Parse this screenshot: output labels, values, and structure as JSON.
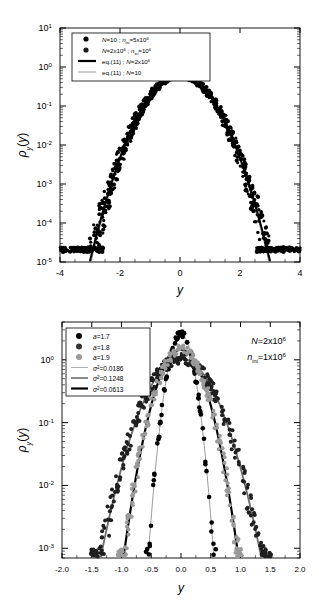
{
  "figure": {
    "panels": [
      "top-panel",
      "bottom-panel"
    ],
    "background": "#ffffff",
    "ink": "#000000",
    "gray": "#8c8c8c"
  },
  "chart_data": [
    {
      "id": "top-panel",
      "type": "scatter",
      "title": "",
      "xlabel": "y",
      "ylabel": "ρy(y)",
      "yscale": "log",
      "xscale": "linear",
      "xlim": [
        -4,
        4
      ],
      "ylim": [
        1e-05,
        10
      ],
      "grid": false,
      "legend_position": "upper-left",
      "xticks": [
        -4,
        -2,
        0,
        2,
        4
      ],
      "xticklabels": [
        "-4",
        "-2",
        "0",
        "2",
        "4"
      ],
      "yticks": [
        1e-05,
        0.0001,
        0.001,
        0.01,
        0.1,
        1,
        10
      ],
      "yticklabels": [
        "10-5",
        "10-4",
        "10-3",
        "10-2",
        "10-1",
        "100",
        "101"
      ],
      "ytick_exponents": [
        "-5",
        "-4",
        "-3",
        "-2",
        "-1",
        "0",
        "1"
      ],
      "legend": [
        {
          "marker": "circle",
          "color": "#000000",
          "label": "N=10 ; nini=5x106",
          "label_parts": {
            "N": "N=10",
            "sep": " ; ",
            "n": "n",
            "nsub": "ini",
            "neq": "=5x10",
            "nexp": "6"
          }
        },
        {
          "marker": "circle",
          "color": "#1a1a1a",
          "label": "N=2x106 ; nini=106",
          "label_parts": {
            "N": "N=2x10",
            "Nexp": "6",
            "sep": " ; ",
            "n": "n",
            "nsub": "ini",
            "neq": "=10",
            "nexp": "6"
          }
        },
        {
          "marker": "line-thick",
          "color": "#000000",
          "label": "eq.(11) ; N=2x106",
          "label_parts": {
            "eq": "eq.(11) ; ",
            "N": "N=2x10",
            "Nexp": "6"
          }
        },
        {
          "marker": "line-thin",
          "color": "#8c8c8c",
          "label": "eq.(11) ; N=10",
          "label_parts": {
            "eq": "eq.(11) ; ",
            "N": "N=10"
          }
        }
      ],
      "series": [
        {
          "name": "eq.(11) ; N=2x10^6",
          "kind": "line",
          "color": "#000000",
          "width": 2.2,
          "sigma2": 0.41,
          "peak": 0.62,
          "x_range": [
            -3.35,
            3.35
          ]
        },
        {
          "name": "eq.(11) ; N=10",
          "kind": "line",
          "color": "#8c8c8c",
          "width": 1.0,
          "sigma2": 0.4,
          "peak": 0.6,
          "x_range": [
            -3.3,
            3.3
          ]
        },
        {
          "name": "N=10 ; nini=5x10^6",
          "kind": "scatter",
          "color": "#000000",
          "noise_floor": 2e-05,
          "x_extent": [
            -4.0,
            4.0
          ]
        },
        {
          "name": "N=2x10^6 ; nini=10^6",
          "kind": "scatter",
          "color": "#000000",
          "noise_floor": 2e-05,
          "x_extent": [
            -3.1,
            3.1
          ]
        }
      ],
      "points_note": "Gaussian-like cloud rho(y)~exp(-y^2/2sigma^2) with saturation floor 2e-5 spreading to |y|=4"
    },
    {
      "id": "bottom-panel",
      "type": "scatter",
      "title": "",
      "xlabel": "y",
      "ylabel": "ρy(y)",
      "yscale": "log",
      "xscale": "linear",
      "xlim": [
        -2.0,
        2.0
      ],
      "ylim": [
        0.0007,
        4.0
      ],
      "grid": false,
      "legend_position": "upper-left",
      "xticks": [
        -2.0,
        -1.5,
        -1.0,
        -0.5,
        0.0,
        0.5,
        1.0,
        1.5,
        2.0
      ],
      "xticklabels": [
        "-2.0",
        "-1.5",
        "-1.0",
        "-0.5",
        "0.0",
        "0.5",
        "1.0",
        "1.5",
        "2.0"
      ],
      "yticks": [
        0.001,
        0.01,
        0.1,
        1
      ],
      "yticklabels": [
        "10-3",
        "10-2",
        "10-1",
        "100"
      ],
      "ytick_exponents": [
        "-3",
        "-2",
        "-1",
        "0"
      ],
      "annotation": {
        "line1": "N=2x106",
        "line1_parts": {
          "base": "N=2x10",
          "exp": "6"
        },
        "line2": "nini=1x106",
        "line2_parts": {
          "sym": "n",
          "sub": "ini",
          "base": "=1x10",
          "exp": "6"
        }
      },
      "legend": [
        {
          "marker": "circle",
          "color": "#000000",
          "label": "a=1.7",
          "label_parts": {
            "sym": "a",
            "val": "=1.7"
          }
        },
        {
          "marker": "circle",
          "color": "#333333",
          "label": "a=1.8",
          "label_parts": {
            "sym": "a",
            "val": "=1.8"
          }
        },
        {
          "marker": "circle",
          "color": "#9a9a9a",
          "label": "a=1.9",
          "label_parts": {
            "sym": "a",
            "val": "=1.9"
          }
        },
        {
          "marker": "line-thin",
          "color": "#9a9a9a",
          "label": "σ2=0.0186",
          "label_parts": {
            "sym": "σ",
            "exp": "2",
            "val": "=0.0186"
          }
        },
        {
          "marker": "line-med",
          "color": "#6e6e6e",
          "label": "σ2=0.1248",
          "label_parts": {
            "sym": "σ",
            "exp": "2",
            "val": "=0.1248"
          }
        },
        {
          "marker": "line-thick",
          "color": "#000000",
          "label": "σ2=0.0613",
          "label_parts": {
            "sym": "σ",
            "exp": "2",
            "val": "=0.0613"
          }
        }
      ],
      "series": [
        {
          "name": "a=1.7",
          "kind": "scatter",
          "color": "#000000",
          "sigma2": 0.0186,
          "peak": 2.6,
          "x_extent": [
            -0.58,
            0.58
          ]
        },
        {
          "name": "a=1.8",
          "kind": "scatter",
          "color": "#1f1f1f",
          "sigma2": 0.1248,
          "peak": 1.05,
          "x_extent": [
            -1.52,
            1.38
          ]
        },
        {
          "name": "a=1.9",
          "kind": "scatter",
          "color": "#9a9a9a",
          "sigma2": 0.0613,
          "peak": 1.45,
          "x_extent": [
            -1.08,
            1.02
          ]
        },
        {
          "name": "sigma2=0.0186",
          "kind": "line",
          "color": "#9a9a9a",
          "width": 1.0,
          "sigma2": 0.0186,
          "peak": 2.6
        },
        {
          "name": "sigma2=0.1248",
          "kind": "line",
          "color": "#6e6e6e",
          "width": 1.8,
          "sigma2": 0.1248,
          "peak": 1.05
        },
        {
          "name": "sigma2=0.0613",
          "kind": "line",
          "color": "#000000",
          "width": 2.2,
          "sigma2": 0.0613,
          "peak": 1.45
        }
      ]
    }
  ]
}
